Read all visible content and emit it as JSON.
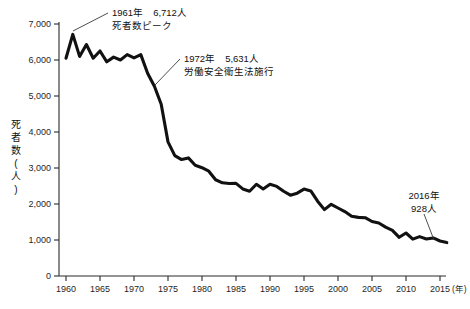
{
  "chart_data": {
    "type": "line",
    "title": "",
    "xlabel": "年",
    "ylabel": "死者数(人)",
    "xlim": [
      1960,
      2016
    ],
    "ylim": [
      0,
      7000
    ],
    "grid": false,
    "legend": null,
    "x_unit_label": "(年)",
    "y_axis_title_chars": [
      "死",
      "者",
      "数",
      "(",
      "人",
      ")"
    ],
    "yticks": [
      0,
      1000,
      2000,
      3000,
      4000,
      5000,
      6000,
      7000
    ],
    "ytick_labels": [
      "0",
      "1,000",
      "2,000",
      "3,000",
      "4,000",
      "5,000",
      "6,000",
      "7,000"
    ],
    "xticks": [
      1960,
      1965,
      1970,
      1975,
      1980,
      1985,
      1990,
      1995,
      2000,
      2005,
      2010,
      2015
    ],
    "xtick_labels": [
      "1960",
      "1965",
      "1970",
      "1975",
      "1980",
      "1985",
      "1990",
      "1995",
      "2000",
      "2005",
      "2010",
      "2015"
    ],
    "series": [
      {
        "name": "労働災害死者数",
        "color": "#111111",
        "x": [
          1960,
          1961,
          1962,
          1963,
          1964,
          1965,
          1966,
          1967,
          1968,
          1969,
          1970,
          1971,
          1972,
          1973,
          1974,
          1975,
          1976,
          1977,
          1978,
          1979,
          1980,
          1981,
          1982,
          1983,
          1984,
          1985,
          1986,
          1987,
          1988,
          1989,
          1990,
          1991,
          1992,
          1993,
          1994,
          1995,
          1996,
          1997,
          1998,
          1999,
          2000,
          2001,
          2002,
          2003,
          2004,
          2005,
          2006,
          2007,
          2008,
          2009,
          2010,
          2011,
          2012,
          2013,
          2014,
          2015,
          2016
        ],
        "values": [
          6050,
          6712,
          6100,
          6430,
          6050,
          6250,
          5950,
          6080,
          6000,
          6150,
          6060,
          6150,
          5631,
          5269,
          4770,
          3725,
          3345,
          3235,
          3280,
          3077,
          3009,
          2912,
          2674,
          2588,
          2568,
          2572,
          2419,
          2354,
          2549,
          2419,
          2550,
          2489,
          2354,
          2245,
          2301,
          2414,
          2363,
          2078,
          1844,
          1992,
          1889,
          1790,
          1658,
          1628,
          1620,
          1514,
          1472,
          1357,
          1268,
          1075,
          1195,
          1024,
          1093,
          1030,
          1057,
          972,
          928
        ]
      }
    ],
    "annotations": [
      {
        "id": "peak-1961",
        "lines": [
          "1961年　6,712人",
          "死者数ピーク"
        ],
        "year": 1961,
        "value": 6712
      },
      {
        "id": "law-1972",
        "lines": [
          "1972年　5,631人",
          "労働安全衛生法施行"
        ],
        "year": 1972,
        "value": 5631
      },
      {
        "id": "latest-2016",
        "lines": [
          "2016年",
          "928人"
        ],
        "year": 2016,
        "value": 928
      }
    ]
  }
}
